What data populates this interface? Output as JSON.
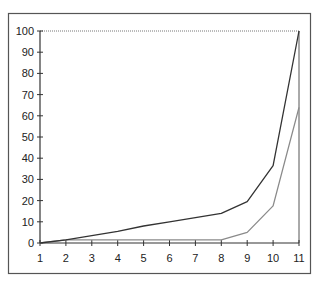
{
  "chart_data": {
    "type": "line",
    "title": "",
    "xlabel": "",
    "ylabel": "",
    "x": [
      1,
      2,
      3,
      4,
      5,
      6,
      7,
      8,
      9,
      10,
      11
    ],
    "xlim": [
      1,
      11
    ],
    "ylim": [
      0,
      100
    ],
    "yticks": [
      0,
      10,
      20,
      30,
      40,
      50,
      60,
      70,
      80,
      90,
      100
    ],
    "xticks": [
      1,
      2,
      3,
      4,
      5,
      6,
      7,
      8,
      9,
      10,
      11
    ],
    "grid": false,
    "legend": null,
    "series": [
      {
        "name": "series-dark",
        "color": "#333333",
        "values": [
          0,
          1.5,
          3.5,
          5.5,
          8,
          10,
          12,
          14,
          19.5,
          36.5,
          100
        ]
      },
      {
        "name": "series-light",
        "color": "#8a8a8a",
        "values": [
          0,
          1.5,
          1.5,
          1.5,
          1.5,
          1.5,
          1.5,
          1.5,
          5,
          17.5,
          64
        ]
      }
    ]
  },
  "colors": {
    "frame": "#555555",
    "axis": "#333333",
    "background": "#ffffff"
  }
}
